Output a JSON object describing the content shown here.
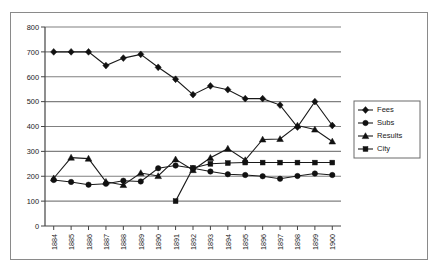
{
  "chart_data": {
    "type": "line",
    "title": "",
    "xlabel": "",
    "ylabel": "",
    "ylim": [
      0,
      800
    ],
    "yticks": [
      0,
      100,
      200,
      300,
      400,
      500,
      600,
      700,
      800
    ],
    "grid": true,
    "legend_position": "right",
    "categories": [
      "1884",
      "1885",
      "1886",
      "1887",
      "1888",
      "1889",
      "1890",
      "1891",
      "1892",
      "1893",
      "1894",
      "1895",
      "1896",
      "1897",
      "1898",
      "1899",
      "1900"
    ],
    "series": [
      {
        "name": "Fees",
        "marker": "diamond",
        "values": [
          700,
          700,
          700,
          645,
          675,
          690,
          638,
          590,
          528,
          563,
          548,
          512,
          512,
          486,
          398,
          500,
          404
        ]
      },
      {
        "name": "Subs",
        "marker": "circle",
        "values": [
          185,
          177,
          166,
          170,
          182,
          179,
          232,
          243,
          232,
          219,
          208,
          205,
          200,
          190,
          201,
          211,
          205
        ]
      },
      {
        "name": "Results",
        "marker": "triangle",
        "values": [
          192,
          275,
          271,
          178,
          165,
          213,
          201,
          268,
          225,
          274,
          311,
          265,
          348,
          350,
          404,
          388,
          340
        ]
      },
      {
        "name": "City",
        "marker": "square",
        "values": [
          null,
          null,
          null,
          null,
          null,
          null,
          null,
          100,
          233,
          250,
          253,
          255,
          255,
          255,
          255,
          255,
          255
        ]
      }
    ]
  },
  "legend": {
    "entries": [
      {
        "label": "Fees"
      },
      {
        "label": "Subs"
      },
      {
        "label": "Results"
      },
      {
        "label": "City"
      }
    ]
  }
}
